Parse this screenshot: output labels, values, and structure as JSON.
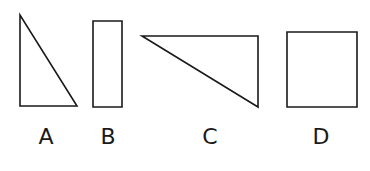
{
  "figure": {
    "background_color": "#ffffff",
    "stroke_color": "#1a1a1a",
    "width": 370,
    "height": 171
  },
  "shapes": [
    {
      "id": "shape-a",
      "label": "A",
      "kind": "right-triangle",
      "orientation": "right angle at bottom-left, apex at top-left",
      "points": "20,15 20,106 77,106",
      "bbox": {
        "x": 20,
        "y": 15,
        "width": 57,
        "height": 91
      }
    },
    {
      "id": "shape-b",
      "label": "B",
      "kind": "rectangle",
      "orientation": "tall vertical rectangle",
      "points": "93,21 122,21 122,107 93,107",
      "bbox": {
        "x": 93,
        "y": 21,
        "width": 29,
        "height": 86
      }
    },
    {
      "id": "shape-c",
      "label": "C",
      "kind": "right-triangle",
      "orientation": "right angle at top-right, apex pointing left",
      "points": "142,36 258,36 258,107",
      "bbox": {
        "x": 142,
        "y": 36,
        "width": 116,
        "height": 71
      }
    },
    {
      "id": "shape-d",
      "label": "D",
      "kind": "square",
      "orientation": "upright square",
      "points": "287,32 357,32 357,107 287,107",
      "bbox": {
        "x": 287,
        "y": 32,
        "width": 70,
        "height": 75
      }
    }
  ],
  "labels": {
    "a": "A",
    "b": "B",
    "c": "C",
    "d": "D"
  }
}
